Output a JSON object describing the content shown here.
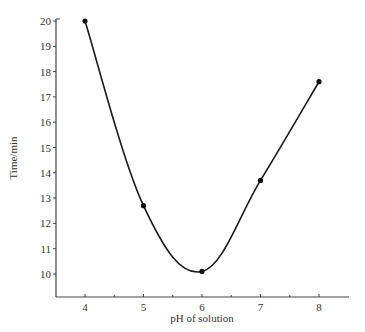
{
  "chart_data": {
    "type": "line",
    "title": "",
    "xlabel": "pH of solution",
    "ylabel": "Time/min",
    "x": [
      4,
      5,
      6,
      7,
      8
    ],
    "series": [
      {
        "name": "Time",
        "values": [
          20.0,
          12.7,
          10.1,
          13.7,
          17.6
        ]
      }
    ],
    "xticks": [
      4,
      5,
      6,
      7,
      8
    ],
    "yticks": [
      10,
      11,
      12,
      13,
      14,
      15,
      16,
      17,
      18,
      19,
      20
    ],
    "xlim": [
      3.5,
      8.5
    ],
    "ylim": [
      9,
      20
    ],
    "grid": false,
    "legend": "none",
    "line_color": "#1a1a1a",
    "marker": "filled-circle"
  }
}
